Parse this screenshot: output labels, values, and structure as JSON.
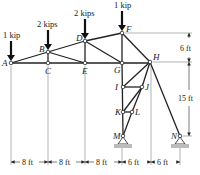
{
  "diagram": {
    "type": "truss",
    "nodes": [
      {
        "id": "A",
        "x": 11,
        "y": 63
      },
      {
        "id": "B",
        "x": 48,
        "y": 52
      },
      {
        "id": "C",
        "x": 48,
        "y": 63
      },
      {
        "id": "D",
        "x": 85,
        "y": 41
      },
      {
        "id": "E",
        "x": 85,
        "y": 63
      },
      {
        "id": "F",
        "x": 122,
        "y": 33
      },
      {
        "id": "G",
        "x": 122,
        "y": 63
      },
      {
        "id": "H",
        "x": 150,
        "y": 62
      },
      {
        "id": "I",
        "x": 123,
        "y": 87
      },
      {
        "id": "J",
        "x": 142,
        "y": 87
      },
      {
        "id": "K",
        "x": 123,
        "y": 112
      },
      {
        "id": "L",
        "x": 132,
        "y": 112
      },
      {
        "id": "M",
        "x": 123,
        "y": 136
      },
      {
        "id": "N",
        "x": 180,
        "y": 136
      }
    ],
    "members": [
      [
        "A",
        "B"
      ],
      [
        "B",
        "D"
      ],
      [
        "D",
        "F"
      ],
      [
        "A",
        "C"
      ],
      [
        "C",
        "E"
      ],
      [
        "E",
        "G"
      ],
      [
        "G",
        "H"
      ],
      [
        "B",
        "C"
      ],
      [
        "D",
        "E"
      ],
      [
        "F",
        "G"
      ],
      [
        "B",
        "E"
      ],
      [
        "D",
        "G"
      ],
      [
        "F",
        "H"
      ],
      [
        "G",
        "I"
      ],
      [
        "I",
        "K"
      ],
      [
        "K",
        "M"
      ],
      [
        "H",
        "J"
      ],
      [
        "J",
        "L"
      ],
      [
        "L",
        "M"
      ],
      [
        "H",
        "I"
      ],
      [
        "I",
        "J"
      ],
      [
        "J",
        "K"
      ],
      [
        "K",
        "L"
      ],
      [
        "H",
        "N"
      ]
    ],
    "loads": [
      {
        "node": "A",
        "label": "1 kip"
      },
      {
        "node": "B",
        "label": "2 kips"
      },
      {
        "node": "D",
        "label": "2 kips"
      },
      {
        "node": "F",
        "label": "1 kip"
      }
    ],
    "supports": [
      {
        "node": "M",
        "type": "pin"
      },
      {
        "node": "N",
        "type": "pin"
      }
    ],
    "dimensions": {
      "horizontal": [
        "8 ft",
        "8 ft",
        "8 ft",
        "6 ft",
        "6 ft"
      ],
      "vertical": [
        "6 ft",
        "15 ft"
      ]
    }
  }
}
